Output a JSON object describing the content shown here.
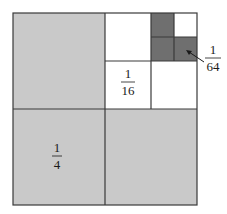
{
  "diagram": {
    "colors": {
      "quarter_fill": "#c9c9c9",
      "sixteenth_fill": "#ffffff",
      "sixtyfourth_fill": "#6f6f6f",
      "line": "#3a3a3a"
    },
    "labels": {
      "quarter": {
        "numerator": "1",
        "denominator": "4"
      },
      "sixteenth": {
        "numerator": "1",
        "denominator": "16"
      },
      "sixtyfourth": {
        "numerator": "1",
        "denominator": "64"
      }
    }
  }
}
